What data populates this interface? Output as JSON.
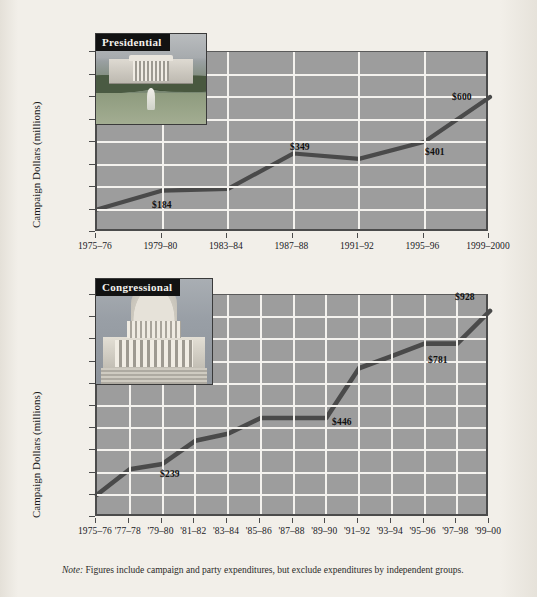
{
  "figure": {
    "note_label": "Note:",
    "note_text": " Figures include campaign and party expenditures, but exclude expenditures by independent groups."
  },
  "presidential": {
    "title": "Presidential",
    "photo_name": "white-house-photo",
    "y_axis_title": "Campaign Dollars (millions)",
    "y_ticks": [
      "$800",
      "700",
      "600",
      "500",
      "400",
      "300",
      "200",
      "100",
      "0"
    ],
    "x_ticks": [
      "1975–76",
      "1979–80",
      "1983–84",
      "1987–88",
      "1991–92",
      "1995–96",
      "1999–2000"
    ],
    "data_labels": [
      "$184",
      "$349",
      "$401",
      "$600"
    ]
  },
  "congressional": {
    "title": "Congressional",
    "photo_name": "us-capitol-photo",
    "y_axis_title": "Campaign Dollars (millions)",
    "y_ticks": [
      "$1000",
      "900",
      "800",
      "700",
      "600",
      "500",
      "400",
      "300",
      "200",
      "100",
      "0"
    ],
    "x_ticks": [
      "1975–76",
      "'77–78",
      "'79–80",
      "'81–82",
      "'83–84",
      "'85–86",
      "'87–88",
      "'89–90",
      "'91–92",
      "'93–94",
      "'95–96",
      "'97–98",
      "'99–00"
    ],
    "data_labels": [
      "$239",
      "$446",
      "$781",
      "$928"
    ]
  },
  "colors": {
    "plot_background": "#9d9d9d",
    "gridline": "#f4f2ee",
    "series_line": "#4a4a4a",
    "axis": "#4b4b4b",
    "page_background": "#f1eee8"
  },
  "chart_data": [
    {
      "type": "line",
      "title": "Presidential",
      "xlabel": "",
      "ylabel": "Campaign Dollars (millions)",
      "ylim": [
        0,
        800
      ],
      "grid": true,
      "legend": "none",
      "categories": [
        "1975–76",
        "1979–80",
        "1983–84",
        "1987–88",
        "1991–92",
        "1995–96",
        "1999–2000"
      ],
      "values": [
        100,
        184,
        192,
        349,
        325,
        401,
        600
      ],
      "annotations": [
        {
          "category": "1979–80",
          "text": "$184",
          "value": 184
        },
        {
          "category": "1987–88",
          "text": "$349",
          "value": 349
        },
        {
          "category": "1995–96",
          "text": "$401",
          "value": 401
        },
        {
          "category": "1999–2000",
          "text": "$600",
          "value": 600
        }
      ]
    },
    {
      "type": "line",
      "title": "Congressional",
      "xlabel": "",
      "ylabel": "Campaign Dollars (millions)",
      "ylim": [
        0,
        1000
      ],
      "grid": true,
      "legend": "none",
      "categories": [
        "1975–76",
        "'77–78",
        "'79–80",
        "'81–82",
        "'83–84",
        "'85–86",
        "'87–88",
        "'89–90",
        "'91–92",
        "'93–94",
        "'95–96",
        "'97–98",
        "'99–00"
      ],
      "values": [
        100,
        215,
        239,
        343,
        375,
        446,
        446,
        446,
        670,
        725,
        781,
        781,
        928
      ],
      "annotations": [
        {
          "category": "'79–80",
          "text": "$239",
          "value": 239
        },
        {
          "category": "'89–90",
          "text": "$446",
          "value": 446
        },
        {
          "category": "'95–96",
          "text": "$781",
          "value": 781
        },
        {
          "category": "'99–00",
          "text": "$928",
          "value": 928
        }
      ]
    }
  ]
}
